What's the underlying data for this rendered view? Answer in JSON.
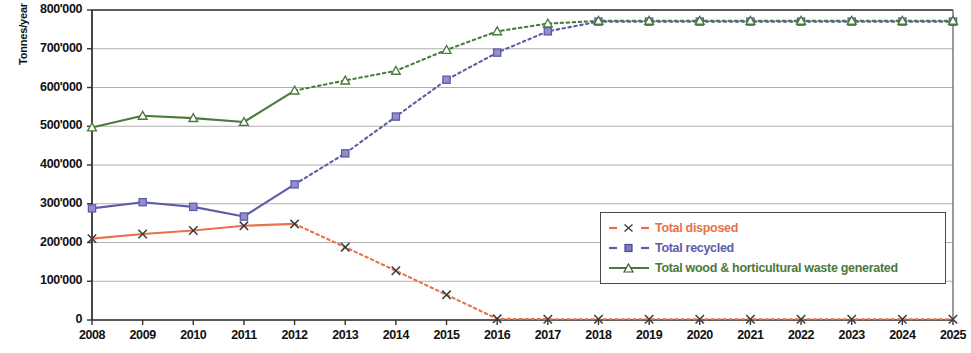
{
  "chart_data": {
    "type": "line",
    "title": "",
    "xlabel": "",
    "ylabel": "Tonnes/year",
    "x": [
      2008,
      2009,
      2010,
      2011,
      2012,
      2013,
      2014,
      2015,
      2016,
      2017,
      2018,
      2019,
      2020,
      2021,
      2022,
      2023,
      2024,
      2025
    ],
    "xtick_labels": [
      "2008",
      "2009",
      "2010",
      "2011",
      "2012",
      "2013",
      "2014",
      "2015",
      "2016",
      "2017",
      "2018",
      "2019",
      "2020",
      "2021",
      "2022",
      "2023",
      "2024",
      "2025"
    ],
    "ylim": [
      0,
      800000
    ],
    "ytick_values": [
      0,
      100000,
      200000,
      300000,
      400000,
      500000,
      600000,
      700000,
      800000
    ],
    "ytick_labels": [
      "0",
      "100'000",
      "200'000",
      "300'000",
      "400'000",
      "500'000",
      "600'000",
      "700'000",
      "800'000"
    ],
    "grid": true,
    "legend_position": "lower-right inside plot",
    "series": [
      {
        "name": "Total disposed",
        "color": "#E8714A",
        "marker": "x",
        "marker_color": "#3a3a3a",
        "linestyle": "dashed",
        "values": [
          210000,
          222000,
          231000,
          243000,
          248000,
          188000,
          127000,
          65000,
          3000,
          2000,
          2000,
          2000,
          2000,
          2000,
          2000,
          2000,
          2000,
          2000
        ],
        "solid_through": 2012
      },
      {
        "name": "Total recycled",
        "color": "#5C5CA8",
        "marker": "square",
        "marker_color": "#5C5CA8",
        "linestyle": "dashed",
        "values": [
          288000,
          304000,
          292000,
          267000,
          350000,
          430000,
          525000,
          620000,
          690000,
          745000,
          770000,
          770000,
          770000,
          770000,
          770000,
          770000,
          770000,
          770000
        ],
        "solid_through": 2012
      },
      {
        "name": "Total wood & horticultural waste generated",
        "color": "#4A7A3C",
        "marker": "triangle",
        "marker_color": "#4A7A3C",
        "linestyle": "dashed",
        "values": [
          497000,
          527000,
          521000,
          511000,
          592000,
          618000,
          643000,
          697000,
          745000,
          765000,
          772000,
          772000,
          772000,
          772000,
          772000,
          772000,
          772000,
          772000
        ],
        "solid_through": 2012
      }
    ],
    "legend_entries": [
      {
        "label": "Total disposed",
        "color": "#E8714A"
      },
      {
        "label": "Total recycled",
        "color": "#5C5CA8"
      },
      {
        "label": "Total wood & horticultural waste generated",
        "color": "#4A7A3C"
      }
    ]
  }
}
